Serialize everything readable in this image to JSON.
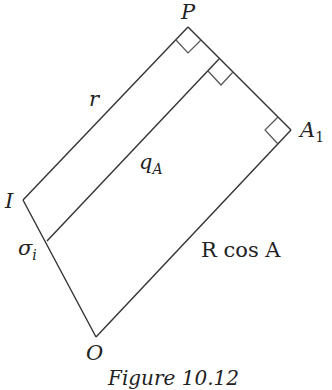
{
  "figure": {
    "caption": "Figure 10.12",
    "points": {
      "P": {
        "label": "P"
      },
      "A1": {
        "label": "A",
        "subscript": "1"
      },
      "I": {
        "label": "I"
      },
      "O": {
        "label": "O"
      },
      "sigma": {
        "label": "σ",
        "subscript": "i"
      }
    },
    "segments": {
      "r": {
        "label": "r"
      },
      "qA": {
        "label": "q",
        "subscript": "A"
      },
      "RcosA": {
        "label": "R cos A"
      }
    },
    "right_angle_markers": 3,
    "line_color": "#333333"
  }
}
